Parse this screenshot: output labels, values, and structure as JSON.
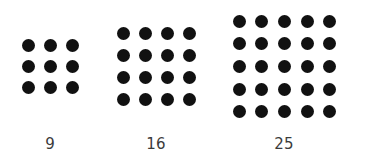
{
  "figure": {
    "title": "",
    "background_color": "#ffffff",
    "dot_color": "#111111",
    "label_color": "#3b3b3b",
    "dot_diameter_px": 13,
    "dot_pitch_px": 25
  },
  "chart_data": {
    "type": "diagram",
    "subtype": "square-number-dot-arrays",
    "title": "",
    "subtitle": "",
    "xlabel": "",
    "ylabel": "",
    "legend": [],
    "annotations": [],
    "grid": false,
    "categories": [
      "9",
      "16",
      "25"
    ],
    "values": [
      9,
      16,
      25
    ],
    "groups": [
      {
        "label": "9",
        "rows": 3,
        "cols": 3,
        "count": 9,
        "side": 3,
        "left_px": 18,
        "top_px": 35,
        "width_px": 65,
        "height_px": 63,
        "center_x_px": 50,
        "label_y_px": 136
      },
      {
        "label": "16",
        "rows": 4,
        "cols": 4,
        "count": 16,
        "side": 4,
        "left_px": 112,
        "top_px": 22,
        "width_px": 88,
        "height_px": 88,
        "center_x_px": 156,
        "label_y_px": 136
      },
      {
        "label": "25",
        "rows": 5,
        "cols": 5,
        "count": 25,
        "side": 5,
        "left_px": 228,
        "top_px": 10,
        "width_px": 113,
        "height_px": 113,
        "center_x_px": 284,
        "label_y_px": 136
      }
    ]
  }
}
